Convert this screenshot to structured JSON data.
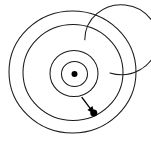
{
  "figure": {
    "background_color": "#ffffff",
    "stroke_color": "#1a1a1a",
    "accent_color": "#000000",
    "width": 151,
    "height": 149
  },
  "chart_data": {
    "type": "scatter",
    "title": "Archimedean spiral with radial pitch marker",
    "xlabel": "",
    "ylabel": "",
    "xlim": [
      0,
      151
    ],
    "ylim": [
      0,
      149
    ],
    "grid": false,
    "legend": null,
    "center": {
      "x": 74.5,
      "y": 74.0,
      "label": "origin"
    },
    "rings": [
      {
        "index": 1,
        "radius_x": 13.0,
        "radius_y": 12.5,
        "cx": 74.5,
        "cy": 74.0
      },
      {
        "index": 2,
        "radius_x": 24.0,
        "radius_y": 23.0,
        "cx": 74.0,
        "cy": 73.5
      },
      {
        "index": 3,
        "radius_x": 36.5,
        "radius_y": 35.0,
        "cx": 73.5,
        "cy": 73.0
      },
      {
        "index": 4,
        "radius_x": 50.0,
        "radius_y": 48.0,
        "cx": 73.0,
        "cy": 72.5
      },
      {
        "index": 5,
        "radius_x": 63.5,
        "radius_y": 61.0,
        "cx": 72.5,
        "cy": 72.0
      }
    ],
    "ring_count": 5,
    "annotation": {
      "kind": "arrow",
      "description": "radial spacing arrow between adjacent spiral turns",
      "from": {
        "x": 82.0,
        "y": 97.5
      },
      "to": {
        "x": 94.5,
        "y": 114.0
      },
      "endpoint_marker": "filled-dot",
      "label": ""
    }
  }
}
